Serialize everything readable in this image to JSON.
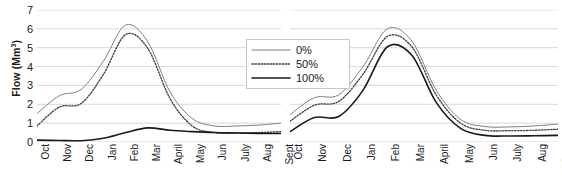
{
  "chart_data": {
    "type": "line",
    "title": "",
    "xlabel": "",
    "ylabel": "Flow (Mm3)",
    "ylabel_base": "Flow (Mm",
    "ylabel_sup": "3",
    "ylabel_close": ")",
    "ylim": [
      0,
      7
    ],
    "yticks": [
      0,
      1,
      2,
      3,
      4,
      5,
      6,
      7
    ],
    "grid": true,
    "legend_position": "top-center-right",
    "panels": [
      {
        "name": "left-panel",
        "categories": [
          "Oct",
          "Nov",
          "Dec",
          "Jan",
          "Feb",
          "Mar",
          "April",
          "May",
          "Jun",
          "July",
          "Aug",
          "Sept"
        ],
        "series": [
          {
            "name": "0%",
            "style": "solid-thin-gray",
            "values": [
              1.5,
              2.45,
              2.8,
              4.3,
              6.2,
              5.3,
              2.65,
              1.25,
              0.85,
              0.85,
              0.9,
              1.0
            ]
          },
          {
            "name": "50%",
            "style": "dotted",
            "values": [
              0.85,
              1.85,
              2.05,
              3.6,
              5.7,
              4.95,
              2.3,
              0.85,
              0.5,
              0.48,
              0.5,
              0.55
            ]
          },
          {
            "name": "100%",
            "style": "solid-thick-black",
            "values": [
              0.1,
              0.08,
              0.07,
              0.2,
              0.5,
              0.75,
              0.62,
              0.55,
              0.5,
              0.48,
              0.46,
              0.45
            ]
          }
        ]
      },
      {
        "name": "right-panel",
        "categories": [
          "Oct",
          "Nov",
          "Dec",
          "Jan",
          "Feb",
          "Mar",
          "April",
          "May",
          "Jun",
          "July",
          "Aug",
          "Sept"
        ],
        "series": [
          {
            "name": "0%",
            "style": "solid-thin-gray",
            "values": [
              1.45,
              2.35,
              2.5,
              4.0,
              6.0,
              5.35,
              2.75,
              1.2,
              0.82,
              0.8,
              0.85,
              0.95
            ]
          },
          {
            "name": "50%",
            "style": "dotted",
            "values": [
              1.1,
              1.95,
              2.15,
              3.6,
              5.6,
              5.05,
              2.5,
              1.0,
              0.62,
              0.6,
              0.62,
              0.68
            ]
          },
          {
            "name": "100%",
            "style": "solid-thick-black",
            "values": [
              0.55,
              1.3,
              1.35,
              2.75,
              5.05,
              4.6,
              2.1,
              0.72,
              0.35,
              0.32,
              0.33,
              0.35
            ]
          }
        ]
      }
    ],
    "legend": [
      {
        "label": "0%",
        "style": "solid-thin-gray"
      },
      {
        "label": "50%",
        "style": "dotted"
      },
      {
        "label": "100%",
        "style": "solid-thick-black"
      }
    ],
    "colors": {
      "series_0pct": "#808080",
      "series_50pct": "#3a3a3a",
      "series_100pct": "#1a1a1a",
      "gridline": "#d9d9d9",
      "text": "#1a1a1a",
      "legend_border": "#c8c8c8",
      "background": "#ffffff"
    }
  }
}
